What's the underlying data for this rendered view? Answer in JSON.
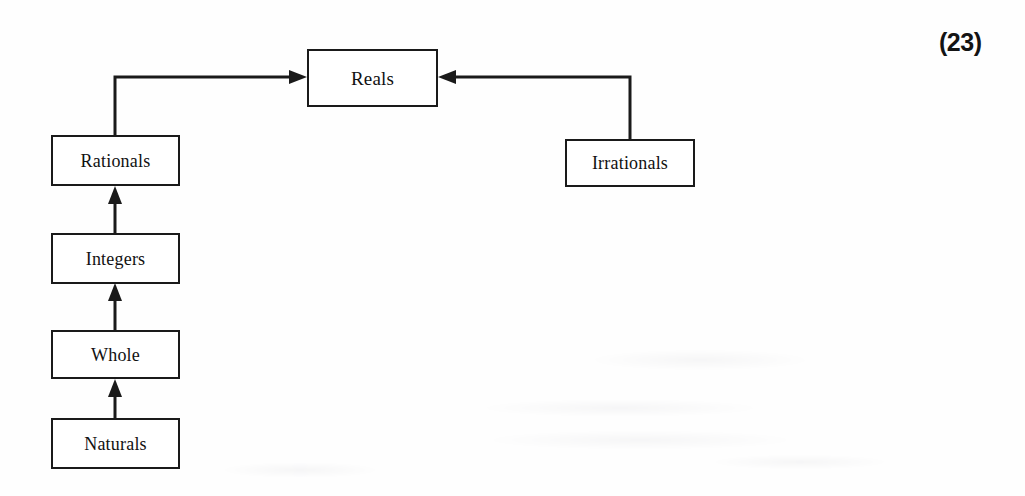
{
  "page": {
    "number_label": "(23)",
    "background_color": "#fefefe",
    "ink_color": "#1a1a1a",
    "width": 1025,
    "height": 496
  },
  "diagram": {
    "nodes": [
      {
        "id": "reals",
        "label": "Reals",
        "x": 307,
        "y": 49,
        "w": 131,
        "h": 58,
        "font_size": 19
      },
      {
        "id": "rationals",
        "label": "Rationals",
        "x": 51,
        "y": 135,
        "w": 129,
        "h": 51,
        "font_size": 18
      },
      {
        "id": "integers",
        "label": "Integers",
        "x": 51,
        "y": 233,
        "w": 129,
        "h": 51,
        "font_size": 18
      },
      {
        "id": "whole",
        "label": "Whole",
        "x": 51,
        "y": 330,
        "w": 129,
        "h": 49,
        "font_size": 18
      },
      {
        "id": "naturals",
        "label": "Naturals",
        "x": 51,
        "y": 418,
        "w": 129,
        "h": 51,
        "font_size": 18
      },
      {
        "id": "irrationals",
        "label": "Irrationals",
        "x": 565,
        "y": 139,
        "w": 130,
        "h": 48,
        "font_size": 18
      }
    ],
    "edges": [
      {
        "id": "naturals-to-whole",
        "from": "naturals",
        "to": "whole",
        "kind": "straight-up",
        "arrow": "up"
      },
      {
        "id": "whole-to-integers",
        "from": "whole",
        "to": "integers",
        "kind": "straight-up",
        "arrow": "up"
      },
      {
        "id": "integers-to-rationals",
        "from": "integers",
        "to": "rationals",
        "kind": "straight-up",
        "arrow": "up"
      },
      {
        "id": "rationals-to-reals",
        "from": "rationals",
        "to": "reals",
        "kind": "elbow-right",
        "arrow": "right"
      },
      {
        "id": "irrationals-to-reals",
        "from": "irrationals",
        "to": "reals",
        "kind": "elbow-left",
        "arrow": "left"
      }
    ]
  }
}
